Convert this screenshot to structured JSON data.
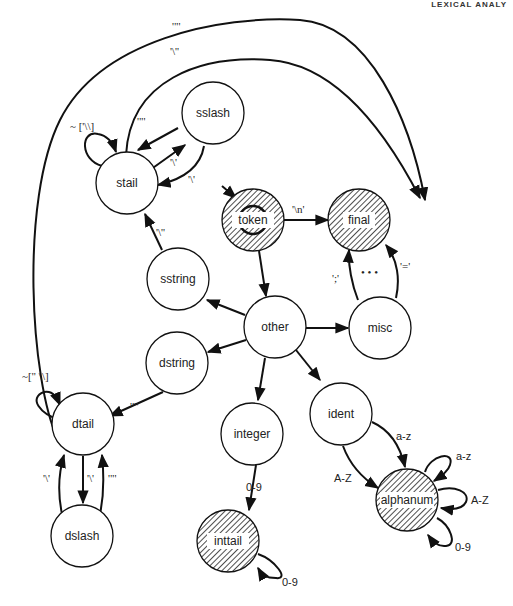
{
  "header": {
    "running_head": "LEXICAL ANALY"
  },
  "nodes": {
    "stail": "stail",
    "sslash": "sslash",
    "token": "token",
    "final": "final",
    "sstring": "sstring",
    "other": "other",
    "misc": "misc",
    "dstring": "dstring",
    "dtail": "dtail",
    "integer": "integer",
    "ident": "ident",
    "dslash": "dslash",
    "inttail": "inttail",
    "alphanum": "alphanum"
  },
  "edges": {
    "dtail_to_final_top": "'\"'",
    "stail_to_final": "'\\''",
    "stail_self": "~ ['\\\\]",
    "stail_to_sslash": "'\"'",
    "sslash_to_stail_1": "'\\'",
    "sslash_to_stail_2": "'\\'",
    "sstring_to_stail": "'\\''",
    "token_to_final": "'\\n'",
    "misc_to_final_left": "';'",
    "misc_ellipsis": "• • •",
    "misc_to_final_right": "'='",
    "dtail_self": "~[\" \\\\]",
    "dstring_to_dtail": "'\"'",
    "dslash_to_dtail_1": "'\\'",
    "dtail_to_dslash": "'\\'",
    "dslash_to_dtail_2": "'\"'",
    "integer_to_inttail": "0-9",
    "inttail_self": "0-9",
    "ident_to_alphanum_az": "a-z",
    "ident_to_alphanum_AZ": "A-Z",
    "alphanum_self_az": "a-z",
    "alphanum_self_AZ": "A-Z",
    "alphanum_self_09": "0-9"
  },
  "colors": {
    "stroke": "#111111",
    "fill": "#ffffff",
    "hatch": "#222222"
  }
}
